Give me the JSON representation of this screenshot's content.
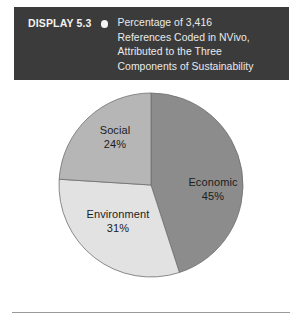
{
  "header": {
    "display_label": "DISPLAY 5.3",
    "bullet_icon": "filled-circle-icon",
    "caption_lines": [
      "Percentage of 3,416",
      "References Coded in NVivo,",
      "Attributed to the Three",
      "Components of Sustainability"
    ],
    "background_color": "#3b3b3b",
    "text_color": "#eaeaea"
  },
  "chart_data": {
    "type": "pie",
    "title": "Percentage of 3,416 References Coded in NVivo, Attributed to the Three Components of Sustainability",
    "xlabel": "",
    "ylabel": "",
    "total_references": "3,416",
    "start_angle_deg": 0,
    "direction": "clockwise",
    "legend": "none",
    "grid": false,
    "categories": [
      "Economic",
      "Environment",
      "Social"
    ],
    "values": [
      45,
      31,
      24
    ],
    "value_labels": [
      "45%",
      "31%",
      "24%"
    ],
    "colors": [
      "#8c8c8c",
      "#e2e2e2",
      "#b6b6b6"
    ],
    "slices": [
      {
        "name": "Economic",
        "value": 45,
        "value_label": "45%",
        "color": "#8c8c8c",
        "start_deg": 0,
        "end_deg": 162,
        "label_x": 213,
        "label_y": 102,
        "pct_x": 213,
        "pct_y": 116
      },
      {
        "name": "Environment",
        "value": 31,
        "value_label": "31%",
        "color": "#e2e2e2",
        "start_deg": 162,
        "end_deg": 273.6,
        "label_x": 118,
        "label_y": 134,
        "pct_x": 118,
        "pct_y": 148
      },
      {
        "name": "Social",
        "value": 24,
        "value_label": "24%",
        "color": "#b6b6b6",
        "start_deg": 273.6,
        "end_deg": 360,
        "label_x": 115,
        "label_y": 50,
        "pct_x": 115,
        "pct_y": 64
      }
    ]
  },
  "footer": {
    "rule_color": "#9a9a9a"
  }
}
